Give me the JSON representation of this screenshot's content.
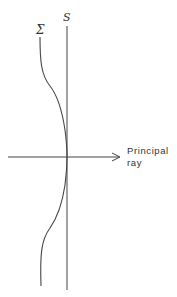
{
  "diagram": {
    "labels": {
      "sigma": "Σ",
      "s": "S",
      "principal_ray_line1": "Principal",
      "principal_ray_line2": "ray"
    },
    "colors": {
      "line": "#444444",
      "background": "#ffffff"
    }
  }
}
